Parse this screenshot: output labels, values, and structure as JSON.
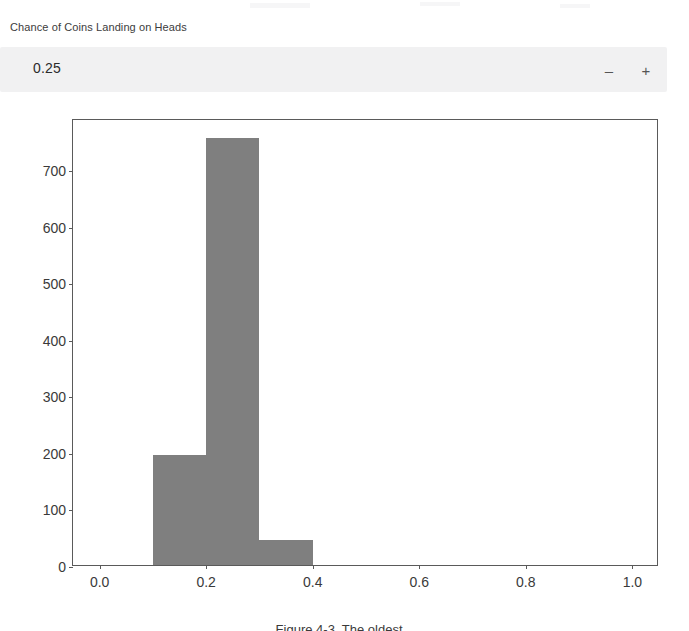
{
  "widget": {
    "label": "Chance of Coins Landing on Heads",
    "value": "0.25",
    "decrement_label": "–",
    "increment_label": "+",
    "panel_color": "#f1f1f2"
  },
  "caption": {
    "text": "Figure 4-3. The oldest..."
  },
  "chart_data": {
    "type": "bar",
    "title": "",
    "xlabel": "",
    "ylabel": "",
    "bar_color": "#7f7f7f",
    "grid": false,
    "legend": null,
    "xlim": [
      -0.05,
      1.05
    ],
    "ylim": [
      0,
      790
    ],
    "xticks": [
      "0.0",
      "0.2",
      "0.4",
      "0.6",
      "0.8",
      "1.0"
    ],
    "xtick_values": [
      0.0,
      0.2,
      0.4,
      0.6,
      0.8,
      1.0
    ],
    "yticks": [
      "0",
      "100",
      "200",
      "300",
      "400",
      "500",
      "600",
      "700"
    ],
    "ytick_values": [
      0,
      100,
      200,
      300,
      400,
      500,
      600,
      700
    ],
    "bin_edges": [
      0.1,
      0.2,
      0.3,
      0.4
    ],
    "categories": [
      "0.1–0.2",
      "0.2–0.3",
      "0.3–0.4"
    ],
    "values": [
      195,
      755,
      44
    ]
  }
}
